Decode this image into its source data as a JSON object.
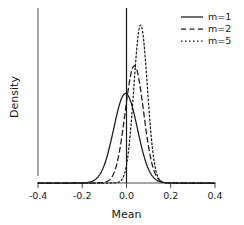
{
  "chart_data": {
    "type": "line",
    "title": "",
    "xlabel": "Mean",
    "ylabel": "Density",
    "xlim": [
      -0.47,
      0.47
    ],
    "ylim": [
      0,
      1.05
    ],
    "grid": false,
    "x_ticks": [
      -0.4,
      -0.2,
      0.0,
      0.2,
      0.4
    ],
    "x_tick_labels": [
      "-0.4",
      "-0.2",
      "0.0",
      "0.2",
      "0.4"
    ],
    "y_ticks": [],
    "y_tick_labels": [],
    "legend_position": "top-right",
    "annotations": [
      {
        "type": "vertical-reference-line",
        "x": 0.0,
        "style": "solid"
      }
    ],
    "series": [
      {
        "name": "m=1",
        "linestyle": "solid",
        "color": "#1a1a1a",
        "distribution": "normal",
        "mean": -0.005,
        "sd": 0.063,
        "peak_density": 0.55
      },
      {
        "name": "m=2",
        "linestyle": "dashed",
        "color": "#1a1a1a",
        "distribution": "normal",
        "mean": 0.042,
        "sd": 0.049,
        "peak_density": 0.72
      },
      {
        "name": "m=5",
        "linestyle": "dotted",
        "color": "#1a1a1a",
        "distribution": "normal",
        "mean": 0.075,
        "sd": 0.036,
        "peak_density": 0.97
      }
    ]
  },
  "legend": {
    "entries": [
      {
        "label": "m=1",
        "linestyle": "solid"
      },
      {
        "label": "m=2",
        "linestyle": "dashed"
      },
      {
        "label": "m=5",
        "linestyle": "dotted"
      }
    ]
  },
  "axes": {
    "x_title": "Mean",
    "y_title": "Density"
  }
}
